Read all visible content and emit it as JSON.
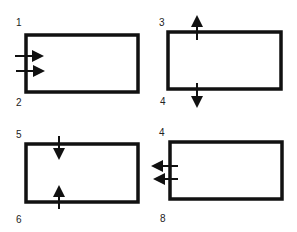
{
  "panels": [
    {
      "top_label": "1",
      "bottom_label": "2",
      "arrows": "two-right-entering-left-edge"
    },
    {
      "top_label": "3",
      "bottom_label": "4",
      "arrows": "up-out-top-and-down-out-bottom"
    },
    {
      "top_label": "5",
      "bottom_label": "6",
      "arrows": "down-into-top-and-up-into-bottom"
    },
    {
      "top_label": "4",
      "bottom_label": "8",
      "arrows": "two-left-exiting-left-edge"
    }
  ],
  "colors": {
    "stroke": "#111111",
    "background": "#ffffff"
  }
}
